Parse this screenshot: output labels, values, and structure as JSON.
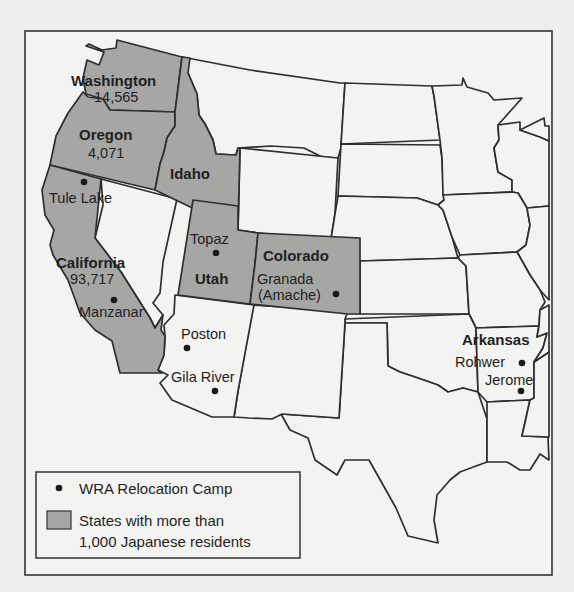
{
  "map": {
    "title": "",
    "states_labeled": [
      {
        "id": "washington",
        "name": "Washington",
        "japanese_residents": "14,565",
        "shaded": true
      },
      {
        "id": "oregon",
        "name": "Oregon",
        "japanese_residents": "4,071",
        "shaded": true
      },
      {
        "id": "idaho",
        "name": "Idaho",
        "shaded": true
      },
      {
        "id": "california",
        "name": "California",
        "japanese_residents": "93,717",
        "shaded": true
      },
      {
        "id": "utah",
        "name": "Utah",
        "shaded": true
      },
      {
        "id": "colorado",
        "name": "Colorado",
        "shaded": true
      },
      {
        "id": "arkansas",
        "name": "Arkansas",
        "shaded": true
      }
    ],
    "camps": [
      {
        "name": "Tule Lake",
        "state": "California"
      },
      {
        "name": "Manzanar",
        "state": "California"
      },
      {
        "name": "Topaz",
        "state": "Utah"
      },
      {
        "name": "Granada",
        "name_line2": "(Amache)",
        "state": "Colorado"
      },
      {
        "name": "Poston",
        "state": "Arizona"
      },
      {
        "name": "Gila River",
        "state": "Arizona"
      },
      {
        "name": "Rohwer",
        "state": "Arkansas"
      },
      {
        "name": "Jerome",
        "state": "Arkansas"
      }
    ],
    "colors": {
      "shaded_state": "#a6a6a4",
      "unshaded_state": "#f3f3f1",
      "border": "#2e2e2e",
      "background": "#eeeeec"
    }
  },
  "legend": {
    "camp_label": "WRA Relocation Camp",
    "shaded_label_line1": "States with more than",
    "shaded_label_line2": "1,000 Japanese residents"
  }
}
